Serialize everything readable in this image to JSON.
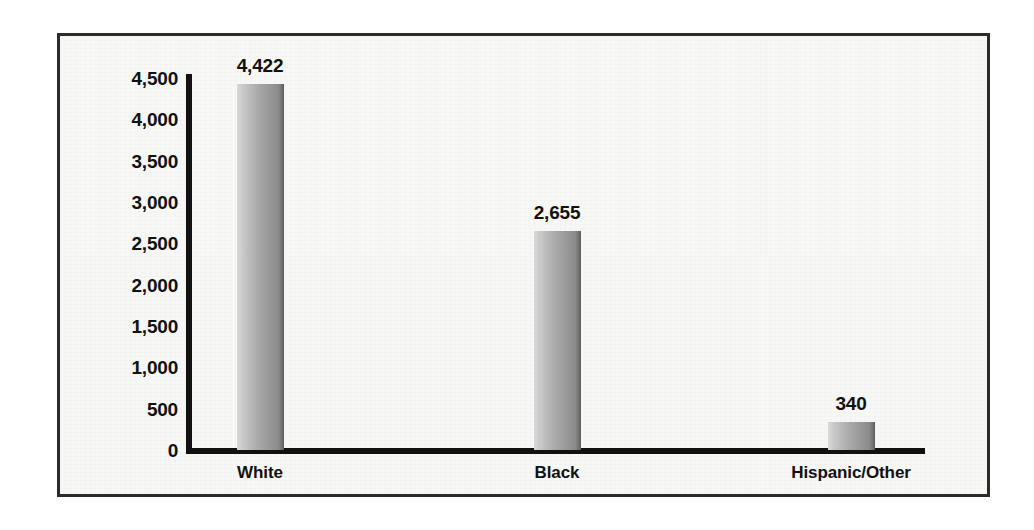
{
  "chart_data": {
    "type": "bar",
    "title": "",
    "subtitle": "",
    "xlabel": "",
    "ylabel": "",
    "categories": [
      "White",
      "Black",
      "Hispanic/Other"
    ],
    "values": [
      4422,
      2655,
      340
    ],
    "value_labels": [
      "4,422",
      "2,655",
      "340"
    ],
    "ylim": [
      0,
      4500
    ],
    "ytick_values": [
      0,
      500,
      1000,
      1500,
      2000,
      2500,
      3000,
      3500,
      4000,
      4500
    ],
    "ytick_labels": [
      "4,500",
      "4,000",
      "3,500",
      "3,000",
      "2,500",
      "2,000",
      "1,500",
      "1,000",
      "500",
      "0"
    ],
    "grid": false,
    "legend": false,
    "legend_position": "none",
    "bar_color": "#a0a0a0",
    "axis_color": "#111111",
    "background_color": "#f7f7f5",
    "frame_color": "#2b2b2b"
  }
}
